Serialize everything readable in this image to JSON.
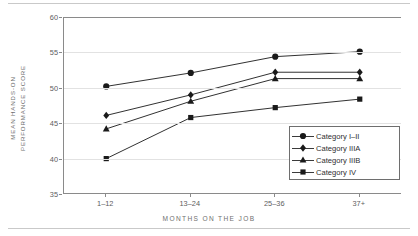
{
  "chart_data": {
    "type": "line",
    "title": "",
    "xlabel": "MONTHS ON THE JOB",
    "ylabel": "MEAN HANDS-ON PERFORMANCE SCORE",
    "ylabel_lines": [
      "MEAN HANDS-ON",
      "PERFORMANCE SCORE"
    ],
    "categories": [
      "1–12",
      "13–24",
      "25–36",
      "37+"
    ],
    "yticks": [
      35,
      40,
      45,
      50,
      55,
      60
    ],
    "ylim": [
      35,
      60
    ],
    "grid": true,
    "legend_position": "lower right",
    "series": [
      {
        "name": "Category I–II",
        "marker": "circle",
        "color": "#1a1a1a",
        "values": [
          50.2,
          52.1,
          54.4,
          55.1
        ]
      },
      {
        "name": "Category IIIA",
        "marker": "diamond",
        "color": "#1a1a1a",
        "values": [
          46.1,
          49.0,
          52.2,
          52.2
        ]
      },
      {
        "name": "Category IIIB",
        "marker": "triangle",
        "color": "#1a1a1a",
        "values": [
          44.2,
          48.1,
          51.3,
          51.3
        ]
      },
      {
        "name": "Category IV",
        "marker": "square",
        "color": "#1a1a1a",
        "values": [
          40.0,
          45.8,
          47.2,
          48.4
        ]
      }
    ]
  },
  "axis": {
    "y_tick_labels": [
      "60",
      "55",
      "50",
      "45",
      "40",
      "35"
    ],
    "x_tick_labels": [
      "1–12",
      "13–24",
      "25–36",
      "37+"
    ],
    "x_title": "MONTHS ON THE JOB",
    "y_title_line1": "MEAN HANDS-ON",
    "y_title_line2": "PERFORMANCE SCORE"
  },
  "legend": {
    "items": [
      {
        "label": "Category I–II"
      },
      {
        "label": "Category IIIA"
      },
      {
        "label": "Category IIIB"
      },
      {
        "label": "Category IV"
      }
    ]
  },
  "colors": {
    "ink": "#1a1a1a",
    "axis": "#8a8a8a",
    "grid": "#e2e2e2",
    "tick_text": "#5d5d5d",
    "title_text": "#6f6f6f",
    "rule": "#c9c9c9"
  }
}
